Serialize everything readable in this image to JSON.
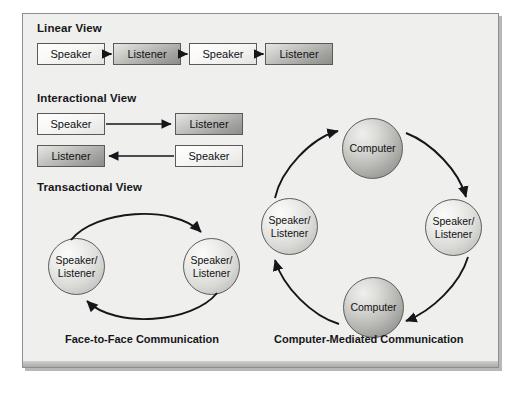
{
  "figure": {
    "panel_bg_color": "#efefed",
    "border_color": "#8e8e8e"
  },
  "face_to_face": {
    "caption": "Face-to-Face Communication",
    "sections": [
      {
        "heading": "Linear View",
        "nodes": [
          {
            "label": "Speaker",
            "style": "light"
          },
          {
            "label": "Listener",
            "style": "dark"
          },
          {
            "label": "Speaker",
            "style": "light"
          },
          {
            "label": "Listener",
            "style": "dark"
          }
        ]
      },
      {
        "heading": "Interactional View",
        "nodes": [
          {
            "label": "Speaker",
            "style": "light"
          },
          {
            "label": "Listener",
            "style": "dark"
          },
          {
            "label": "Listener",
            "style": "dark"
          },
          {
            "label": "Speaker",
            "style": "light"
          }
        ]
      },
      {
        "heading": "Transactional View",
        "nodes": [
          {
            "label_line1": "Speaker/",
            "label_line2": "Listener",
            "style": "pale"
          },
          {
            "label_line1": "Speaker/",
            "label_line2": "Listener",
            "style": "pale"
          }
        ]
      }
    ]
  },
  "computer_mediated": {
    "caption": "Computer-Mediated Communication",
    "nodes": [
      {
        "label_line1": "Computer",
        "label_line2": "",
        "style": "shaded",
        "position": "top"
      },
      {
        "label_line1": "Speaker/",
        "label_line2": "Listener",
        "style": "pale",
        "position": "right"
      },
      {
        "label_line1": "Computer",
        "label_line2": "",
        "style": "shaded",
        "position": "bottom"
      },
      {
        "label_line1": "Speaker/",
        "label_line2": "Listener",
        "style": "pale",
        "position": "left"
      }
    ]
  }
}
